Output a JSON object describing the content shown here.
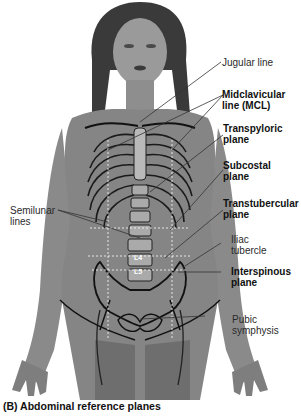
{
  "figure": {
    "caption": "(B) Abdominal reference planes",
    "vertebrae": [
      "L4",
      "L5"
    ],
    "labels_right": [
      {
        "id": "jugular",
        "line1": "Jugular line",
        "line2": "",
        "bold": false
      },
      {
        "id": "mcl",
        "line1": "Midclavicular",
        "line2": "line (MCL)",
        "bold": true
      },
      {
        "id": "transpyloric",
        "line1": "Transpyloric",
        "line2": "plane",
        "bold": true
      },
      {
        "id": "subcostal",
        "line1": "Subcostal",
        "line2": "plane",
        "bold": true
      },
      {
        "id": "transtubercular",
        "line1": "Transtubercular",
        "line2": "plane",
        "bold": true
      },
      {
        "id": "iliac",
        "line1": "Iliac",
        "line2": "tubercle",
        "bold": false
      },
      {
        "id": "interspinous",
        "line1": "Interspinous",
        "line2": "plane",
        "bold": true
      },
      {
        "id": "pubic",
        "line1": "Pubic",
        "line2": "symphysis",
        "bold": false
      }
    ],
    "labels_left": [
      {
        "id": "semilunar",
        "line1": "Semilunar",
        "line2": "lines",
        "bold": false
      }
    ]
  }
}
